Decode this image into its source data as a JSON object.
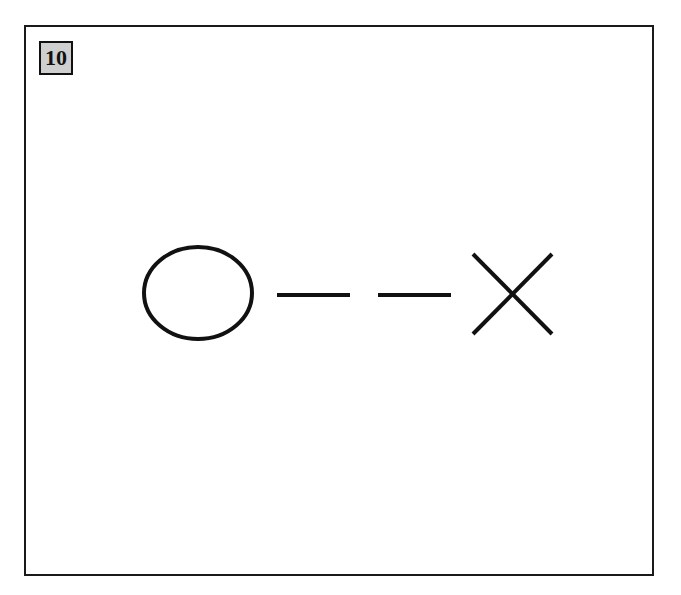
{
  "panel": {
    "number": "10"
  },
  "diagram": {
    "stroke_color": "#111111",
    "fill_color": "#ffffff",
    "badge_color": "#cfcfcf",
    "elements": [
      {
        "type": "circle",
        "label": "O"
      },
      {
        "type": "dash",
        "label": "blank"
      },
      {
        "type": "dash",
        "label": "blank"
      },
      {
        "type": "cross",
        "label": "X"
      }
    ]
  }
}
